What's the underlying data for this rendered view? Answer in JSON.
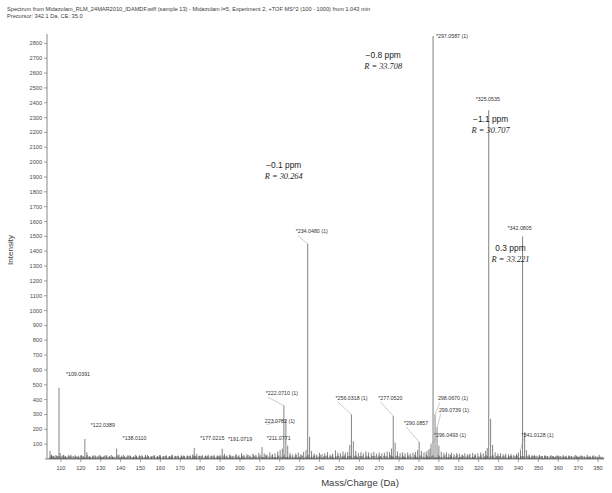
{
  "header": {
    "line1": "Spectrum from Midazolam_RLM_24MAR2010_IDAMDF.wiff (sample 13) - Midazolam l=5, Experiment 2, +TOF MS^2 (100 - 1000) from 1.043 min",
    "line2": "Precursor: 342.1 Da, CE: 35.0"
  },
  "chart_data": {
    "type": "bar",
    "title": "Spectrum from Midazolam_RLM_24MAR2010_IDAMDF.wiff (sample 13) - Midazolam l=5, Experiment 2, +TOF MS^2 (100 - 1000) from 1.043 min",
    "subtitle": "Precursor: 342.1 Da, CE: 35.0",
    "xlabel": "Mass/Charge (Da)",
    "ylabel": "Intensity",
    "xlim": [
      103,
      383
    ],
    "ylim": [
      0,
      2850
    ],
    "grid": false,
    "legend": null,
    "xticks": [
      110,
      120,
      130,
      140,
      150,
      160,
      170,
      180,
      190,
      200,
      210,
      220,
      230,
      240,
      250,
      260,
      270,
      280,
      290,
      300,
      310,
      320,
      330,
      340,
      350,
      360,
      370,
      380
    ],
    "yticks": [
      100,
      200,
      300,
      400,
      500,
      600,
      700,
      800,
      900,
      1000,
      1100,
      1200,
      1300,
      1400,
      1500,
      1600,
      1700,
      1800,
      1900,
      2000,
      2100,
      2200,
      2300,
      2400,
      2500,
      2600,
      2700,
      2800
    ],
    "labeled_peaks": [
      {
        "mz": 109.0391,
        "intensity": 480,
        "label": "*109.0391",
        "label_x": 112.5,
        "label_y": 560,
        "leader": false
      },
      {
        "mz": 122.0389,
        "intensity": 135,
        "label": "*122.0389",
        "label_x": 125.0,
        "label_y": 215,
        "leader": false
      },
      {
        "mz": 138.011,
        "intensity": 70,
        "label": "*138.0110",
        "label_x": 141.0,
        "label_y": 125,
        "leader": false
      },
      {
        "mz": 177.0215,
        "intensity": 75,
        "label": "*177.0215",
        "label_x": 180.0,
        "label_y": 128,
        "leader": false
      },
      {
        "mz": 191.0719,
        "intensity": 70,
        "label": "*191.0719",
        "label_x": 194.0,
        "label_y": 122,
        "leader": false
      },
      {
        "mz": 211.0771,
        "intensity": 80,
        "label": "*211.0771",
        "label_x": 213.5,
        "label_y": 130,
        "leader": false
      },
      {
        "mz": 222.071,
        "intensity": 360,
        "label": "*222.0710 (1)",
        "label_x": 213.0,
        "label_y": 430,
        "leader": true
      },
      {
        "mz": 223.0782,
        "intensity": 265,
        "label": "223.0782 (1)",
        "label_x": 212.5,
        "label_y": 245,
        "leader": true
      },
      {
        "mz": 234.048,
        "intensity": 1450,
        "label": "*234.0480 (1)",
        "label_x": 228.0,
        "label_y": 1520,
        "leader": true
      },
      {
        "mz": 256.0318,
        "intensity": 300,
        "label": "*256.0318 (1)",
        "label_x": 248.0,
        "label_y": 400,
        "leader": true
      },
      {
        "mz": 277.052,
        "intensity": 290,
        "label": "*277.0520",
        "label_x": 269.5,
        "label_y": 400,
        "leader": true
      },
      {
        "mz": 290.0857,
        "intensity": 115,
        "label": "*290.0857",
        "label_x": 282.5,
        "label_y": 230,
        "leader": true
      },
      {
        "mz": 296.0493,
        "intensity": 100,
        "label": "*296.0493 (1)",
        "label_x": 297.5,
        "label_y": 150,
        "leader": true
      },
      {
        "mz": 297.0587,
        "intensity": 2850,
        "label": "*297.0587 (1)",
        "label_x": 298.5,
        "label_y": 2835,
        "leader": false
      },
      {
        "mz": 298.067,
        "intensity": 300,
        "label": "298.0670 (1)",
        "label_x": 299.5,
        "label_y": 395,
        "leader": true
      },
      {
        "mz": 299.0739,
        "intensity": 215,
        "label": "299.0739 (1)",
        "label_x": 300.0,
        "label_y": 320,
        "leader": true
      },
      {
        "mz": 325.0535,
        "intensity": 2350,
        "label": "*325.0535",
        "label_x": 318.5,
        "label_y": 2410,
        "leader": false
      },
      {
        "mz": 341.0128,
        "intensity": 60,
        "label": "*341.0128 (1)",
        "label_x": 341.5,
        "label_y": 150,
        "leader": true
      },
      {
        "mz": 342.0805,
        "intensity": 1500,
        "label": "*342.0805",
        "label_x": 334.5,
        "label_y": 1545,
        "leader": false
      }
    ],
    "annotations": [
      {
        "ppm": "−0.8 ppm",
        "resolution": "R = 33.708",
        "x": 272.0,
        "y": 2700,
        "for_mz": 297.0587
      },
      {
        "ppm": "−1.1 ppm",
        "resolution": "R = 30.707",
        "x": 326.0,
        "y": 2270,
        "for_mz": 325.0535
      },
      {
        "ppm": "−0.1 ppm",
        "resolution": "R = 30.264",
        "x": 222.0,
        "y": 1960,
        "for_mz": 234.048
      },
      {
        "ppm": "0.3 ppm",
        "resolution": "R = 33.221",
        "x": 336.0,
        "y": 1400,
        "for_mz": 342.0805
      }
    ],
    "background_peaks": [
      [
        104.5,
        55
      ],
      [
        105.2,
        30
      ],
      [
        106.0,
        22
      ],
      [
        107.1,
        25
      ],
      [
        108.0,
        18
      ],
      [
        109.0391,
        480
      ],
      [
        109.6,
        40
      ],
      [
        110.5,
        22
      ],
      [
        111.4,
        28
      ],
      [
        112.3,
        18
      ],
      [
        113.6,
        24
      ],
      [
        115.0,
        30
      ],
      [
        116.2,
        20
      ],
      [
        117.5,
        18
      ],
      [
        119.0,
        22
      ],
      [
        120.3,
        25
      ],
      [
        121.2,
        18
      ],
      [
        122.0389,
        135
      ],
      [
        123.0,
        45
      ],
      [
        124.5,
        20
      ],
      [
        126.0,
        18
      ],
      [
        127.3,
        24
      ],
      [
        128.6,
        20
      ],
      [
        130.0,
        22
      ],
      [
        131.5,
        18
      ],
      [
        133.0,
        25
      ],
      [
        134.4,
        20
      ],
      [
        136.0,
        18
      ],
      [
        138.011,
        70
      ],
      [
        139.2,
        30
      ],
      [
        140.5,
        22
      ],
      [
        142.0,
        18
      ],
      [
        143.6,
        24
      ],
      [
        145.0,
        20
      ],
      [
        146.5,
        18
      ],
      [
        148.0,
        22
      ],
      [
        149.5,
        25
      ],
      [
        151.0,
        18
      ],
      [
        152.5,
        28
      ],
      [
        154.0,
        20
      ],
      [
        155.5,
        18
      ],
      [
        157.0,
        24
      ],
      [
        158.5,
        20
      ],
      [
        160.0,
        26
      ],
      [
        161.5,
        18
      ],
      [
        163.0,
        22
      ],
      [
        164.5,
        20
      ],
      [
        166.0,
        30
      ],
      [
        167.5,
        22
      ],
      [
        169.0,
        18
      ],
      [
        170.5,
        26
      ],
      [
        172.0,
        20
      ],
      [
        173.5,
        24
      ],
      [
        175.0,
        22
      ],
      [
        176.2,
        30
      ],
      [
        177.0215,
        75
      ],
      [
        178.3,
        35
      ],
      [
        179.5,
        22
      ],
      [
        181.0,
        26
      ],
      [
        182.5,
        20
      ],
      [
        184.0,
        30
      ],
      [
        185.5,
        22
      ],
      [
        187.0,
        26
      ],
      [
        188.5,
        20
      ],
      [
        190.0,
        28
      ],
      [
        191.0719,
        70
      ],
      [
        192.2,
        35
      ],
      [
        193.5,
        24
      ],
      [
        195.0,
        30
      ],
      [
        196.5,
        22
      ],
      [
        198.0,
        34
      ],
      [
        199.5,
        26
      ],
      [
        200.8,
        40
      ],
      [
        202.0,
        28
      ],
      [
        203.5,
        32
      ],
      [
        205.0,
        24
      ],
      [
        206.5,
        36
      ],
      [
        208.0,
        28
      ],
      [
        209.5,
        42
      ],
      [
        211.0771,
        80
      ],
      [
        212.2,
        38
      ],
      [
        213.5,
        30
      ],
      [
        215.0,
        45
      ],
      [
        216.3,
        32
      ],
      [
        217.6,
        38
      ],
      [
        219.0,
        50
      ],
      [
        220.2,
        60
      ],
      [
        221.3,
        70
      ],
      [
        222.071,
        360
      ],
      [
        223.0782,
        265
      ],
      [
        224.0,
        90
      ],
      [
        225.2,
        40
      ],
      [
        226.5,
        30
      ],
      [
        228.0,
        36
      ],
      [
        229.3,
        44
      ],
      [
        230.6,
        32
      ],
      [
        232.0,
        48
      ],
      [
        233.2,
        60
      ],
      [
        234.048,
        1450
      ],
      [
        235.0,
        150
      ],
      [
        236.0,
        55
      ],
      [
        237.3,
        36
      ],
      [
        238.6,
        30
      ],
      [
        240.0,
        42
      ],
      [
        241.3,
        34
      ],
      [
        242.6,
        38
      ],
      [
        244.0,
        46
      ],
      [
        245.3,
        30
      ],
      [
        246.6,
        36
      ],
      [
        248.0,
        58
      ],
      [
        249.2,
        44
      ],
      [
        250.5,
        38
      ],
      [
        251.8,
        50
      ],
      [
        253.0,
        42
      ],
      [
        254.2,
        48
      ],
      [
        255.2,
        95
      ],
      [
        256.0318,
        300
      ],
      [
        257.0,
        120
      ],
      [
        258.2,
        55
      ],
      [
        259.5,
        40
      ],
      [
        260.8,
        46
      ],
      [
        262.0,
        38
      ],
      [
        263.3,
        52
      ],
      [
        264.6,
        44
      ],
      [
        266.0,
        40
      ],
      [
        267.3,
        48
      ],
      [
        268.6,
        36
      ],
      [
        270.0,
        44
      ],
      [
        271.3,
        38
      ],
      [
        272.6,
        42
      ],
      [
        274.0,
        50
      ],
      [
        275.2,
        46
      ],
      [
        276.2,
        70
      ],
      [
        277.052,
        290
      ],
      [
        278.0,
        110
      ],
      [
        279.2,
        50
      ],
      [
        280.5,
        40
      ],
      [
        281.8,
        46
      ],
      [
        283.0,
        38
      ],
      [
        284.3,
        44
      ],
      [
        285.6,
        36
      ],
      [
        287.0,
        42
      ],
      [
        288.2,
        48
      ],
      [
        289.3,
        60
      ],
      [
        290.0857,
        115
      ],
      [
        291.2,
        55
      ],
      [
        292.5,
        44
      ],
      [
        293.6,
        50
      ],
      [
        294.6,
        60
      ],
      [
        295.5,
        70
      ],
      [
        296.0493,
        100
      ],
      [
        297.0587,
        2850
      ],
      [
        298.067,
        300
      ],
      [
        299.0739,
        215
      ],
      [
        300.0,
        90
      ],
      [
        301.2,
        50
      ],
      [
        302.5,
        40
      ],
      [
        303.8,
        44
      ],
      [
        305.0,
        36
      ],
      [
        306.3,
        42
      ],
      [
        307.6,
        34
      ],
      [
        309.0,
        40
      ],
      [
        310.3,
        36
      ],
      [
        311.6,
        30
      ],
      [
        313.0,
        38
      ],
      [
        314.3,
        32
      ],
      [
        315.6,
        36
      ],
      [
        317.0,
        42
      ],
      [
        318.3,
        34
      ],
      [
        319.6,
        38
      ],
      [
        321.0,
        44
      ],
      [
        322.3,
        40
      ],
      [
        323.5,
        55
      ],
      [
        324.3,
        75
      ],
      [
        325.0535,
        2350
      ],
      [
        326.0,
        270
      ],
      [
        327.0,
        95
      ],
      [
        328.3,
        45
      ],
      [
        329.6,
        36
      ],
      [
        331.0,
        40
      ],
      [
        332.3,
        32
      ],
      [
        333.6,
        36
      ],
      [
        335.0,
        30
      ],
      [
        336.3,
        34
      ],
      [
        337.6,
        28
      ],
      [
        339.0,
        36
      ],
      [
        340.0,
        44
      ],
      [
        341.0128,
        60
      ],
      [
        342.0805,
        1500
      ],
      [
        343.1,
        180
      ],
      [
        344.0,
        60
      ],
      [
        345.3,
        30
      ],
      [
        346.6,
        24
      ],
      [
        348.0,
        28
      ],
      [
        349.3,
        22
      ],
      [
        350.6,
        26
      ],
      [
        352.0,
        20
      ],
      [
        353.3,
        24
      ],
      [
        354.6,
        18
      ],
      [
        356.0,
        22
      ],
      [
        357.3,
        20
      ],
      [
        358.6,
        18
      ],
      [
        360.0,
        24
      ],
      [
        361.3,
        20
      ],
      [
        362.6,
        18
      ],
      [
        364.0,
        22
      ],
      [
        365.3,
        18
      ],
      [
        366.6,
        20
      ],
      [
        368.0,
        18
      ],
      [
        369.3,
        22
      ],
      [
        370.6,
        18
      ],
      [
        372.0,
        20
      ],
      [
        373.3,
        18
      ],
      [
        374.6,
        16
      ],
      [
        376.0,
        20
      ],
      [
        377.3,
        16
      ],
      [
        378.6,
        18
      ],
      [
        380.0,
        16
      ]
    ]
  }
}
